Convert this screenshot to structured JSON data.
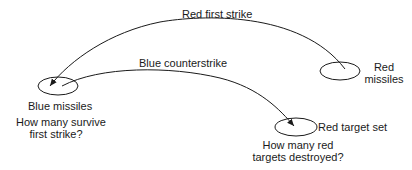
{
  "diagram": {
    "nodes": {
      "blue_missiles": {
        "label": "Blue missiles",
        "question_line1": "How many survive",
        "question_line2": "first strike?"
      },
      "red_missiles": {
        "label_line1": "Red",
        "label_line2": "missiles"
      },
      "red_target_set": {
        "label": "Red target set",
        "question_line1": "How many red",
        "question_line2": "targets destroyed?"
      }
    },
    "edges": {
      "red_first_strike": {
        "label": "Red first strike",
        "from": "Red missiles",
        "to": "Blue missiles"
      },
      "blue_counterstrike": {
        "label": "Blue counterstrike",
        "from": "Blue missiles",
        "to": "Red target set"
      }
    },
    "stroke_color": "#1a1a1a"
  }
}
